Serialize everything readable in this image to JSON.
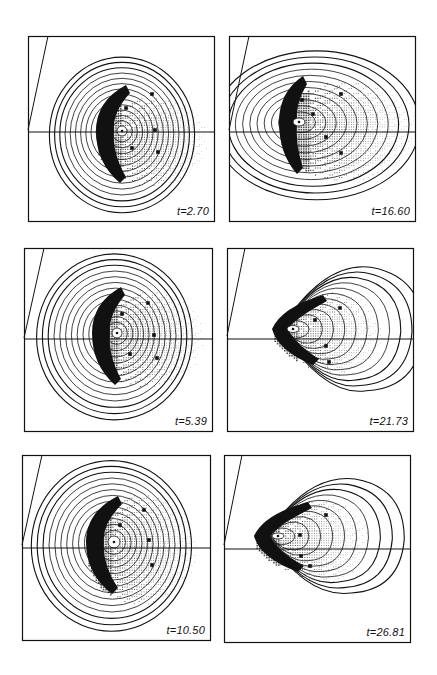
{
  "figure": {
    "panels": [
      {
        "id": "p1",
        "label": "t=2.70",
        "x": 28,
        "y": 36,
        "w": 187,
        "h": 186,
        "axis_y": 96,
        "slant": [
          20,
          0,
          0,
          94
        ],
        "core": [
          94,
          95
        ],
        "rings": 14,
        "ring_rx0": 5,
        "ring_ry0": 5,
        "ring_dx": 5.2,
        "ring_dy": 5.6,
        "ring_shift": -0.6,
        "shape": "round",
        "front_x": 68,
        "dots_extent": [
          68,
          60,
          180,
          150
        ],
        "markers": [
          [
            124,
            58
          ],
          [
            98,
            72
          ],
          [
            127,
            94
          ],
          [
            104,
            112
          ],
          [
            130,
            116
          ]
        ]
      },
      {
        "id": "p2",
        "label": "t=16.60",
        "x": 229,
        "y": 36,
        "w": 187,
        "h": 186,
        "axis_y": 96,
        "slant": [
          20,
          0,
          0,
          94
        ],
        "core": [
          70,
          86
        ],
        "rings": 12,
        "ring_rx0": 6,
        "ring_ry0": 4,
        "ring_dx": 8.8,
        "ring_dy": 6.4,
        "ring_shift": 1.0,
        "shape": "round",
        "front_x": 50,
        "dots_extent": [
          50,
          45,
          185,
          145
        ],
        "markers": [
          [
            112,
            58
          ],
          [
            84,
            78
          ],
          [
            73,
            64
          ],
          [
            97,
            101
          ],
          [
            112,
            117
          ]
        ]
      },
      {
        "id": "p3",
        "label": "t=5.39",
        "x": 24,
        "y": 248,
        "w": 189,
        "h": 184,
        "axis_y": 91,
        "slant": [
          20,
          0,
          0,
          90
        ],
        "core": [
          93,
          85
        ],
        "rings": 14,
        "ring_rx0": 5,
        "ring_ry0": 5,
        "ring_dx": 5.6,
        "ring_dy": 6.0,
        "ring_shift": -0.8,
        "shape": "round",
        "front_x": 68,
        "dots_extent": [
          68,
          42,
          180,
          140
        ],
        "markers": [
          [
            124,
            55
          ],
          [
            98,
            66
          ],
          [
            130,
            87
          ],
          [
            106,
            106
          ],
          [
            133,
            110
          ]
        ]
      },
      {
        "id": "p4",
        "label": "t=21.73",
        "x": 227,
        "y": 248,
        "w": 187,
        "h": 184,
        "axis_y": 91,
        "slant": [
          18,
          0,
          0,
          88
        ],
        "core": [
          66,
          81
        ],
        "rings": 12,
        "ring_rx0": 6,
        "ring_ry0": 3.5,
        "ring_dx": 7.4,
        "ring_dy": 5.3,
        "ring_shift": 0.5,
        "shape": "teardrop",
        "front_x": 45,
        "dots_extent": [
          45,
          42,
          155,
          130
        ],
        "markers": [
          [
            113,
            60
          ],
          [
            88,
            72
          ],
          [
            99,
            98
          ],
          [
            102,
            114
          ]
        ]
      },
      {
        "id": "p5",
        "label": "t=10.50",
        "x": 22,
        "y": 455,
        "w": 189,
        "h": 186,
        "axis_y": 93,
        "slant": [
          20,
          0,
          0,
          90
        ],
        "core": [
          92,
          87
        ],
        "rings": 14,
        "ring_rx0": 6,
        "ring_ry0": 6,
        "ring_dx": 5.7,
        "ring_dy": 6.1,
        "ring_shift": -0.8,
        "shape": "round",
        "front_x": 64,
        "dots_extent": [
          64,
          38,
          175,
          150
        ],
        "markers": [
          [
            122,
            55
          ],
          [
            98,
            70
          ],
          [
            127,
            85
          ],
          [
            130,
            110
          ]
        ]
      },
      {
        "id": "p6",
        "label": "t=26.81",
        "x": 224,
        "y": 455,
        "w": 187,
        "h": 188,
        "axis_y": 94,
        "slant": [
          18,
          0,
          0,
          90
        ],
        "core": [
          54,
          81
        ],
        "rings": 11,
        "ring_rx0": 6,
        "ring_ry0": 3,
        "ring_dx": 7.6,
        "ring_dy": 5.4,
        "ring_shift": 1.0,
        "shape": "teardrop",
        "front_x": 30,
        "dots_extent": [
          30,
          42,
          145,
          130
        ],
        "markers": [
          [
            102,
            60
          ],
          [
            76,
            80
          ],
          [
            77,
            101
          ],
          [
            86,
            111
          ]
        ]
      }
    ]
  },
  "colors": {
    "ink": "#111111",
    "paper": "#ffffff",
    "dot": "#333333"
  }
}
